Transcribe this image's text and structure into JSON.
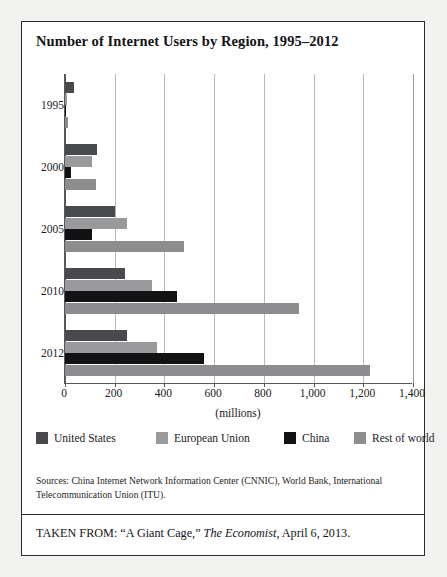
{
  "figure": {
    "title": "Number of Internet Users by Region, 1995–2012",
    "sources": "Sources: China Internet Network Information Center (CNNIC), World Bank, International Telecommunication Union (ITU).",
    "taken_from_prefix": "TAKEN FROM: “A Giant Cage,” ",
    "taken_from_italic": "The Economist",
    "taken_from_suffix": ", April 6, 2013."
  },
  "colors": {
    "united_states": "#494a4e",
    "european_union": "#9a9a9c",
    "china": "#121114",
    "rest_of_world": "#8d8d8f",
    "page_background": "#f2f2f0",
    "panel_background": "#ffffff",
    "border": "#2b2b2b",
    "gridline": "#b9b9bb",
    "axis": "#58585a",
    "text": "#17161a"
  },
  "chart_data": {
    "type": "bar",
    "orientation": "horizontal",
    "title": "Number of Internet Users by Region, 1995–2012",
    "xlabel": "(millions)",
    "ylabel": "",
    "categories": [
      "1995",
      "2000",
      "2005",
      "2010",
      "2012"
    ],
    "xlim": [
      0,
      1400
    ],
    "xticks": [
      0,
      200,
      400,
      600,
      800,
      1000,
      1200,
      1400
    ],
    "xtick_labels": [
      "0",
      "200",
      "400",
      "600",
      "800",
      "1,000",
      "1,200",
      "1,400"
    ],
    "grid": true,
    "legend_position": "bottom",
    "series": [
      {
        "name": "United States",
        "color": "#494a4e",
        "values": [
          35,
          130,
          200,
          240,
          250
        ]
      },
      {
        "name": "European Union",
        "color": "#9a9a9c",
        "values": [
          10,
          110,
          250,
          350,
          370
        ]
      },
      {
        "name": "China",
        "color": "#121114",
        "values": [
          1,
          25,
          110,
          450,
          560
        ]
      },
      {
        "name": "Rest of world",
        "color": "#8d8d8f",
        "values": [
          12,
          125,
          480,
          940,
          1225
        ]
      }
    ]
  }
}
